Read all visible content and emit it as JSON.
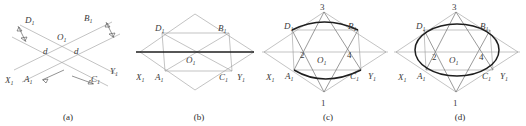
{
  "figure": {
    "panels": [
      {
        "caption": "(a)",
        "description": "two crossing bands of width d",
        "labels": {
          "D": "D",
          "B": "B",
          "O": "O",
          "X": "X",
          "A": "A",
          "C": "C",
          "Y": "Y",
          "sub1": "1",
          "width_left": "d",
          "width_right": "d"
        }
      },
      {
        "caption": "(b)",
        "description": "rhombus with inner parallelogram and bold horizontal axis",
        "labels": {
          "D": "D",
          "B": "B",
          "O": "O",
          "X": "X",
          "A": "A",
          "C": "C",
          "Y": "Y",
          "sub1": "1"
        }
      },
      {
        "caption": "(c)",
        "description": "rhombus with inscribed lens of two arcs and numbered points",
        "labels": {
          "D": "D",
          "B": "B",
          "O": "O",
          "X": "X",
          "A": "A",
          "C": "C",
          "Y": "Y",
          "sub1": "1",
          "p1": "1",
          "p2": "2",
          "p3": "3",
          "p4": "4"
        }
      },
      {
        "caption": "(d)",
        "description": "rhombus with inscribed full ellipse and numbered points",
        "labels": {
          "D": "D",
          "B": "B",
          "O": "O",
          "X": "X",
          "A": "A",
          "C": "C",
          "Y": "Y",
          "sub1": "1",
          "p1": "1",
          "p2": "2",
          "p3": "3",
          "p4": "4"
        }
      }
    ],
    "colors": {
      "thin_line": "#9a9a9a",
      "bold_line": "#1e1e1e",
      "text": "#3a3a3a",
      "background": "#ffffff"
    }
  }
}
